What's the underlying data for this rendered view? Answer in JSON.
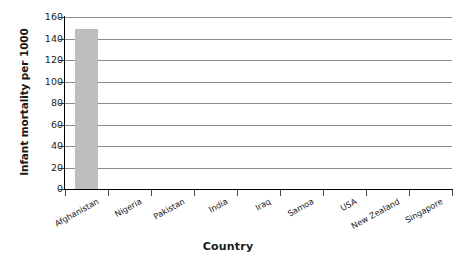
{
  "chart_data": {
    "type": "bar",
    "title": "",
    "xlabel": "Country",
    "ylabel": "Infant mortality per 1000",
    "categories": [
      "Afghanistan",
      "Nigeria",
      "Pakistan",
      "India",
      "Iraq",
      "Samoa",
      "USA",
      "New Zealand",
      "Singapore"
    ],
    "values": [
      149,
      0,
      0,
      0,
      0,
      0,
      0,
      0,
      0
    ],
    "series": [
      {
        "name": "Infant mortality per 1000",
        "values": [
          149,
          0,
          0,
          0,
          0,
          0,
          0,
          0,
          0
        ]
      }
    ],
    "ylim": [
      0,
      160
    ],
    "ytick_labels": [
      "0",
      "20",
      "40",
      "60",
      "80",
      "100",
      "120",
      "140",
      "160"
    ],
    "ytick_values": [
      0,
      20,
      40,
      60,
      80,
      100,
      120,
      140,
      160
    ],
    "grid": true,
    "legend": false,
    "legend_position": "none",
    "bar_color": "#bdbdbd",
    "gridline_color": "#8c8c8c",
    "axis_color": "#000000",
    "background_color": "#ffffff",
    "xtick_label_rotation": -29
  }
}
